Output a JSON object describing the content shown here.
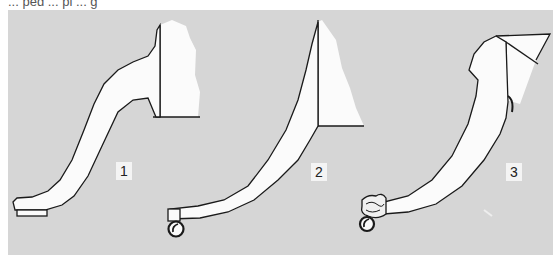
{
  "figure": {
    "caption": "... ped ... pi ... g",
    "background_color": "#a8a8a8",
    "line_color": "#1a1a1a",
    "fill_color": "#fbfbfb",
    "labels": [
      {
        "id": "1",
        "text": "1",
        "description": "cabriole leg with flat pad foot"
      },
      {
        "id": "2",
        "text": "2",
        "description": "sweeping curved leg on brass-cup caster"
      },
      {
        "id": "3",
        "text": "3",
        "description": "scrolled curved leg with carved paw-style caster foot"
      }
    ]
  }
}
